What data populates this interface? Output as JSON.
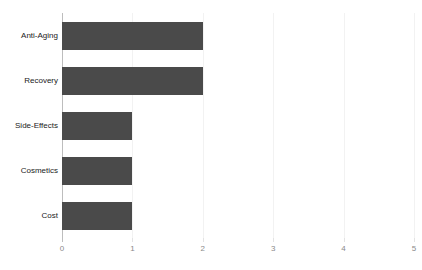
{
  "chart_data": {
    "type": "bar",
    "orientation": "horizontal",
    "title": "",
    "xlabel": "",
    "ylabel": "",
    "categories": [
      "Anti-Aging",
      "Recovery",
      "Side-Effects",
      "Cosmetics",
      "Cost"
    ],
    "values": [
      2,
      2,
      1,
      1,
      1
    ],
    "xlim": [
      0,
      5
    ],
    "xticks": [
      "0",
      "1",
      "2",
      "3",
      "4",
      "5"
    ],
    "grid": true,
    "legend": false,
    "bar_color": "#4a4a4a",
    "gridline_color": "#f2f2f2",
    "axis_color": "#bdbdbd",
    "tick_label_color": "#8a8a8a",
    "category_label_color": "#1a1a1a",
    "background_color": "#ffffff",
    "title_cropped_remnant": "—— ———"
  }
}
